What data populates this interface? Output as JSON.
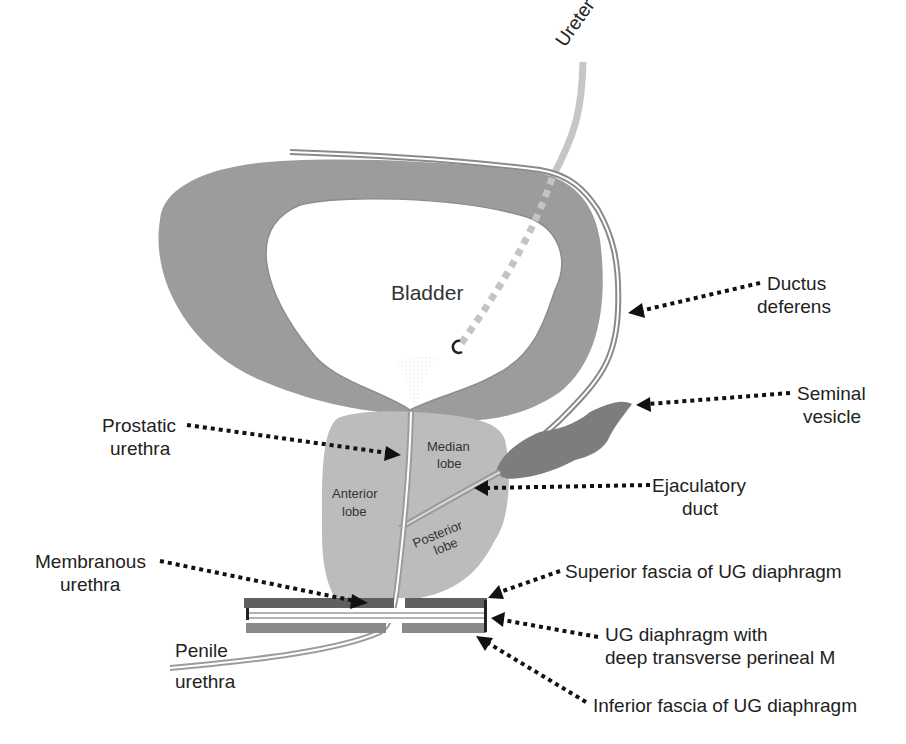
{
  "diagram": {
    "colors": {
      "bladder_wall": "#9a9a9a",
      "bladder_lumen": "#ffffff",
      "prostate": "#bdbdbd",
      "seminal_vesicle": "#7a7a7a",
      "ureter": "#c4c4c4",
      "duct": "#8a8a8a",
      "fascia_dark": "#5f5f5f",
      "fascia_light": "#8c8c8c",
      "text": "#222222",
      "arrow": "#111111"
    },
    "structures": {
      "bladder": "Bladder",
      "ureter": "Ureter",
      "median_lobe_1": "Median",
      "median_lobe_2": "lobe",
      "anterior_lobe_1": "Anterior",
      "anterior_lobe_2": "lobe",
      "posterior_lobe_1": "Posterior",
      "posterior_lobe_2": "lobe"
    },
    "labels": {
      "ductus_deferens_1": "Ductus",
      "ductus_deferens_2": "deferens",
      "seminal_vesicle_1": "Seminal",
      "seminal_vesicle_2": "vesicle",
      "ejaculatory_duct_1": "Ejaculatory",
      "ejaculatory_duct_2": "duct",
      "prostatic_urethra_1": "Prostatic",
      "prostatic_urethra_2": "urethra",
      "membranous_urethra_1": "Membranous",
      "membranous_urethra_2": "urethra",
      "penile_urethra_1": "Penile",
      "penile_urethra_2": "urethra",
      "superior_fascia": "Superior fascia of UG diaphragm",
      "ug_diaphragm_1": "UG diaphragm with",
      "ug_diaphragm_2": "deep transverse perineal M",
      "inferior_fascia": "Inferior fascia of UG diaphragm"
    }
  }
}
